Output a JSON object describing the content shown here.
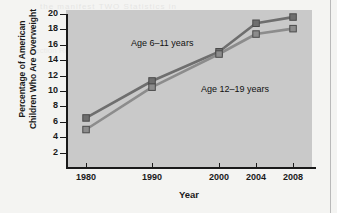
{
  "chart_data": {
    "type": "line",
    "title": "",
    "xlabel": "Year",
    "ylabel": "Percentage of American Children Who Are Overweight",
    "ylabel_line1": "Percentage of American",
    "ylabel_line2": "Children Who Are Overweight",
    "categories": [
      "1980",
      "1990",
      "2000",
      "2004",
      "2008"
    ],
    "x": [
      1980,
      1990,
      2000,
      2004,
      2008
    ],
    "xlim": [
      1976,
      2012
    ],
    "ylim": [
      0,
      20
    ],
    "yticks": [
      2,
      4,
      6,
      8,
      10,
      12,
      14,
      16,
      18,
      20
    ],
    "ytick_labels": [
      "2",
      "4",
      "6",
      "8",
      "10",
      "12",
      "14",
      "16",
      "18",
      "20"
    ],
    "grid": false,
    "legend_position": "inline-annotations",
    "marker": "square",
    "series": [
      {
        "name": "Age 6–11 years",
        "values": [
          6.5,
          11.3,
          15.1,
          18.8,
          19.6
        ],
        "color": "#6e6e6e"
      },
      {
        "name": "Age 12–19 years",
        "values": [
          5.0,
          10.5,
          14.8,
          17.4,
          18.1
        ],
        "color": "#8c8c8c"
      }
    ],
    "annotations": [
      {
        "text": "Age 6–11 years",
        "x_px": 131,
        "y_px": 38
      },
      {
        "text": "Age 12–19 years",
        "x_px": 201,
        "y_px": 84
      }
    ],
    "colors": {
      "plot_background": "#c9c9c9",
      "page_background": "#f4f4f2",
      "axis": "#1a1a1a",
      "series_1": "#6e6e6e",
      "series_2": "#8c8c8c",
      "marker_edge": "#4a4a4a"
    }
  },
  "artifacts": {
    "bleed_top": "the manifest  TWO  Statistics  in",
    "bleed_body": "Section    Review    figure    data"
  }
}
